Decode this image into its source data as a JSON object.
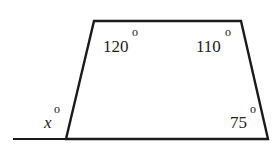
{
  "diagram": {
    "type": "quadrilateral-exterior-angle",
    "angles": {
      "top_left": "120",
      "top_right": "110",
      "bottom_right": "75",
      "exterior": "x"
    },
    "degree_symbol": "o",
    "colors": {
      "stroke": "#1a1a1a",
      "text": "#222222",
      "background": "#ffffff"
    }
  }
}
